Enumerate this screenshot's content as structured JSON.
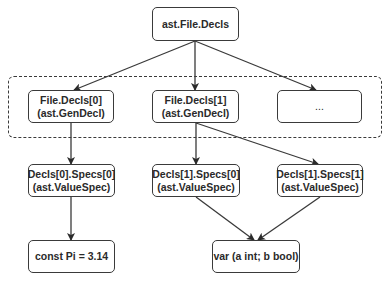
{
  "diagram": {
    "root": {
      "line1": "ast.File.Decls"
    },
    "group_label": "",
    "level1": [
      {
        "line1": "File.Decls[0]",
        "line2": "(ast.GenDecl)"
      },
      {
        "line1": "File.Decls[1]",
        "line2": "(ast.GenDecl)"
      },
      {
        "line1": "..."
      }
    ],
    "level2": [
      {
        "line1": "Decls[0].Specs[0]",
        "line2": "(ast.ValueSpec)"
      },
      {
        "line1": "Decls[1].Specs[0]",
        "line2": "(ast.ValueSpec)"
      },
      {
        "line1": "Decls[1].Specs[1]",
        "line2": "(ast.ValueSpec)"
      }
    ],
    "level3": [
      {
        "line1": "const Pi = 3.14"
      },
      {
        "line1": "var (a int; b bool)"
      }
    ],
    "colors": {
      "stroke": "#3a3a3a",
      "text": "#2a2a2a",
      "background": "#ffffff"
    }
  }
}
